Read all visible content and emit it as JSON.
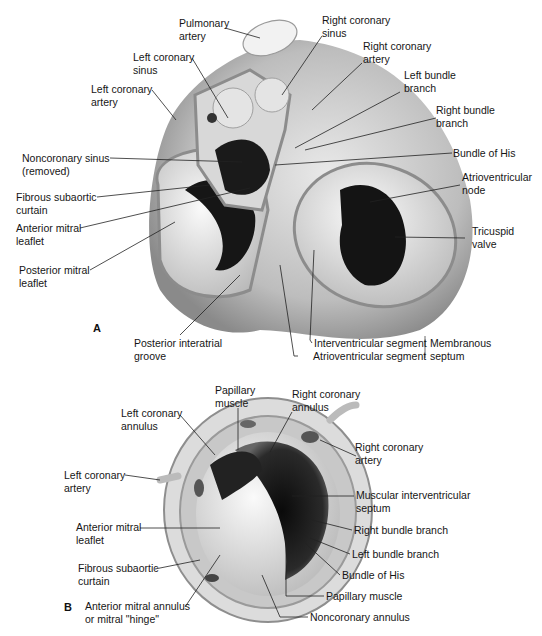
{
  "figure": {
    "panels": [
      {
        "letter": "A",
        "description": "Superior view of cardiac base showing aortic, mitral and tricuspid valves",
        "labels": {
          "pulmonary_artery": [
            "Pulmonary",
            "artery"
          ],
          "left_coronary_sinus": [
            "Left coronary",
            "sinus"
          ],
          "left_coronary_artery": [
            "Left coronary",
            "artery"
          ],
          "right_coronary_sinus": [
            "Right coronary",
            "sinus"
          ],
          "right_coronary_artery": [
            "Right coronary",
            "artery"
          ],
          "left_bundle_branch": [
            "Left bundle",
            "branch"
          ],
          "right_bundle_branch": [
            "Right bundle",
            "branch"
          ],
          "bundle_of_his": [
            "Bundle of His"
          ],
          "noncoronary_sinus": [
            "Noncoronary sinus",
            "(removed)"
          ],
          "fibrous_subaortic_curtain": [
            "Fibrous subaortic",
            "curtain"
          ],
          "anterior_mitral_leaflet": [
            "Anterior mitral",
            "leaflet"
          ],
          "posterior_mitral_leaflet": [
            "Posterior mitral",
            "leaflet"
          ],
          "atrioventricular_node": [
            "Atrioventricular",
            "node"
          ],
          "tricuspid_valve": [
            "Tricuspid",
            "valve"
          ],
          "posterior_interatrial_groove": [
            "Posterior interatrial",
            "groove"
          ],
          "interventricular_segment": [
            "Interventricular segment"
          ],
          "atrioventricular_segment": [
            "Atrioventricular segment"
          ],
          "membranous_septum": [
            "Membranous",
            "septum"
          ]
        }
      },
      {
        "letter": "B",
        "description": "View into left ventricular outflow through aortic annulus",
        "labels": {
          "papillary_muscle_top": [
            "Papillary",
            "muscle"
          ],
          "right_coronary_annulus": [
            "Right coronary",
            "annulus"
          ],
          "left_coronary_annulus": [
            "Left coronary",
            "annulus"
          ],
          "right_coronary_artery": [
            "Right coronary",
            "artery"
          ],
          "left_coronary_artery": [
            "Left coronary",
            "artery"
          ],
          "muscular_interventricular_septum": [
            "Muscular interventricular",
            "septum"
          ],
          "anterior_mitral_leaflet": [
            "Anterior mitral",
            "leaflet"
          ],
          "right_bundle_branch": [
            "Right bundle branch"
          ],
          "left_bundle_branch": [
            "Left bundle branch"
          ],
          "fibrous_subaortic_curtain": [
            "Fibrous subaortic",
            "curtain"
          ],
          "bundle_of_his": [
            "Bundle of His"
          ],
          "papillary_muscle_bottom": [
            "Papillary muscle"
          ],
          "anterior_mitral_annulus": [
            "Anterior mitral annulus",
            "or mitral \"hinge\""
          ],
          "noncoronary_annulus": [
            "Noncoronary annulus"
          ]
        }
      }
    ]
  }
}
